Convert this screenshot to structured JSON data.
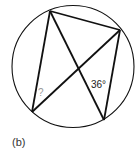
{
  "figure": {
    "caption": "(b)",
    "circle": {
      "cx": 73,
      "cy": 66.5,
      "r": 61
    },
    "points": {
      "A": {
        "x": 50,
        "y": 11
      },
      "B": {
        "x": 120,
        "y": 30
      },
      "C": {
        "x": 104,
        "y": 120
      },
      "D": {
        "x": 32,
        "y": 112
      }
    },
    "chords": [
      [
        "A",
        "B"
      ],
      [
        "A",
        "D"
      ],
      [
        "A",
        "C"
      ],
      [
        "B",
        "D"
      ],
      [
        "B",
        "C"
      ]
    ],
    "labels": {
      "unknown_angle": "?",
      "known_angle": "36°"
    },
    "colors": {
      "line": "#111111",
      "unknown_label": "#999999",
      "known_label": "#222222",
      "caption": "#333333"
    }
  }
}
